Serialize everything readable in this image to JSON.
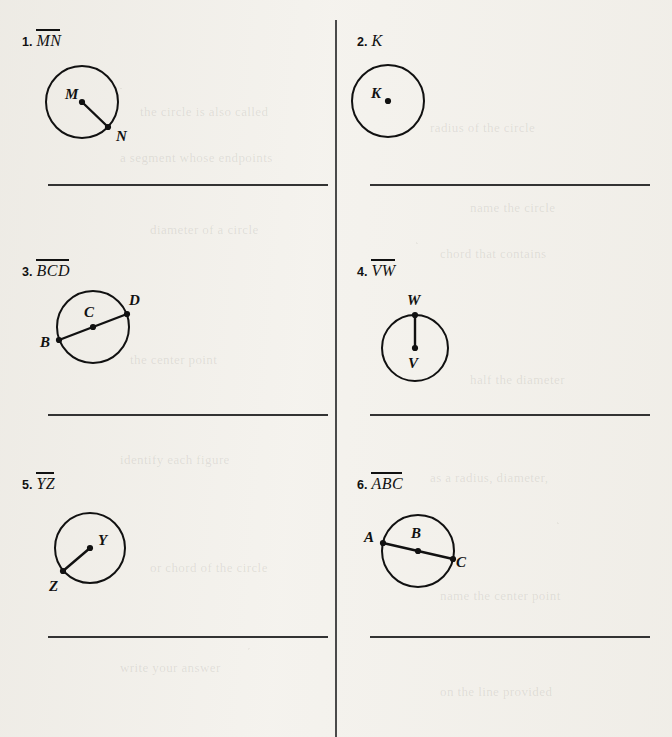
{
  "page": {
    "background_color": "#f3f1ec",
    "ink_color": "#111111",
    "divider": {
      "orientation": "vertical",
      "x": 335,
      "y": 20,
      "height": 717
    }
  },
  "ghost_text": [
    {
      "text": "the circle is also called",
      "x": 140,
      "y": 104
    },
    {
      "text": "radius of the circle",
      "x": 430,
      "y": 120
    },
    {
      "text": "a segment whose endpoints",
      "x": 120,
      "y": 150
    },
    {
      "text": "name the circle",
      "x": 470,
      "y": 200
    },
    {
      "text": "diameter of a circle",
      "x": 150,
      "y": 222
    },
    {
      "text": "chord that contains",
      "x": 440,
      "y": 246
    },
    {
      "text": "the center point",
      "x": 130,
      "y": 352
    },
    {
      "text": "half the diameter",
      "x": 470,
      "y": 372
    },
    {
      "text": "identify each figure",
      "x": 120,
      "y": 452
    },
    {
      "text": "as a radius, diameter,",
      "x": 430,
      "y": 470
    },
    {
      "text": "or chord of the circle",
      "x": 150,
      "y": 560
    },
    {
      "text": "name the center point",
      "x": 440,
      "y": 588
    },
    {
      "text": "write your answer",
      "x": 120,
      "y": 660
    },
    {
      "text": "on the line provided",
      "x": 440,
      "y": 684
    }
  ],
  "items": [
    {
      "number": "1.",
      "term": "MN",
      "overbar": true,
      "label": {
        "x": 22,
        "y": 32
      },
      "rule": {
        "x": 48,
        "y": 184,
        "width": 280
      },
      "figure": {
        "x": 30,
        "y": 55,
        "width": 130,
        "height": 110,
        "center": {
          "cx": 52,
          "cy": 47,
          "r": 36
        },
        "points": [
          {
            "name": "M",
            "cx": 52,
            "cy": 47,
            "label_x": 35,
            "label_y": 44,
            "type": "center"
          },
          {
            "name": "N",
            "cx": 78,
            "cy": 72,
            "label_x": 86,
            "label_y": 86,
            "type": "on-circle"
          }
        ],
        "segment": {
          "x1": 52,
          "y1": 47,
          "x2": 78,
          "y2": 72
        }
      }
    },
    {
      "number": "2.",
      "term": "K",
      "overbar": false,
      "label": {
        "x": 357,
        "y": 32
      },
      "rule": {
        "x": 370,
        "y": 184,
        "width": 280
      },
      "figure": {
        "x": 350,
        "y": 55,
        "width": 130,
        "height": 110,
        "center": {
          "cx": 38,
          "cy": 46,
          "r": 36
        },
        "points": [
          {
            "name": "K",
            "cx": 38,
            "cy": 46,
            "label_x": 21,
            "label_y": 43,
            "type": "center"
          }
        ],
        "segment": null
      }
    },
    {
      "number": "3.",
      "term": "BCD",
      "overbar": true,
      "label": {
        "x": 22,
        "y": 262
      },
      "rule": {
        "x": 48,
        "y": 414,
        "width": 280
      },
      "figure": {
        "x": 30,
        "y": 285,
        "width": 140,
        "height": 112,
        "center": {
          "cx": 63,
          "cy": 42,
          "r": 36
        },
        "points": [
          {
            "name": "B",
            "cx": 29,
            "cy": 55,
            "label_x": 10,
            "label_y": 62,
            "type": "on-circle"
          },
          {
            "name": "C",
            "cx": 63,
            "cy": 42,
            "label_x": 54,
            "label_y": 32,
            "type": "center"
          },
          {
            "name": "D",
            "cx": 97,
            "cy": 29,
            "label_x": 99,
            "label_y": 20,
            "type": "on-circle"
          }
        ],
        "segment": {
          "x1": 29,
          "y1": 55,
          "x2": 97,
          "y2": 29
        }
      }
    },
    {
      "number": "4.",
      "term": "VW",
      "overbar": true,
      "label": {
        "x": 357,
        "y": 262
      },
      "rule": {
        "x": 370,
        "y": 414,
        "width": 280
      },
      "figure": {
        "x": 350,
        "y": 288,
        "width": 135,
        "height": 115,
        "center": {
          "cx": 65,
          "cy": 60,
          "r": 33
        },
        "points": [
          {
            "name": "W",
            "cx": 65,
            "cy": 27,
            "label_x": 57,
            "label_y": 17,
            "type": "on-circle"
          },
          {
            "name": "V",
            "cx": 65,
            "cy": 60,
            "label_x": 58,
            "label_y": 80,
            "type": "center"
          }
        ],
        "segment": {
          "x1": 65,
          "y1": 27,
          "x2": 65,
          "y2": 60
        }
      }
    },
    {
      "number": "5.",
      "term": "YZ",
      "overbar": true,
      "label": {
        "x": 22,
        "y": 475
      },
      "rule": {
        "x": 48,
        "y": 636,
        "width": 280
      },
      "figure": {
        "x": 30,
        "y": 503,
        "width": 135,
        "height": 112,
        "center": {
          "cx": 60,
          "cy": 45,
          "r": 35
        },
        "points": [
          {
            "name": "Y",
            "cx": 60,
            "cy": 45,
            "label_x": 68,
            "label_y": 42,
            "type": "center"
          },
          {
            "name": "Z",
            "cx": 33,
            "cy": 68,
            "label_x": 19,
            "label_y": 88,
            "type": "on-circle"
          }
        ],
        "segment": {
          "x1": 60,
          "y1": 45,
          "x2": 33,
          "y2": 68
        }
      }
    },
    {
      "number": "6.",
      "term": "ABC",
      "overbar": true,
      "label": {
        "x": 357,
        "y": 475
      },
      "rule": {
        "x": 370,
        "y": 636,
        "width": 280
      },
      "figure": {
        "x": 350,
        "y": 505,
        "width": 140,
        "height": 112,
        "center": {
          "cx": 68,
          "cy": 46,
          "r": 36
        },
        "points": [
          {
            "name": "A",
            "cx": 33,
            "cy": 38,
            "label_x": 14,
            "label_y": 37,
            "type": "on-circle"
          },
          {
            "name": "B",
            "cx": 68,
            "cy": 46,
            "label_x": 61,
            "label_y": 33,
            "type": "center"
          },
          {
            "name": "C",
            "cx": 103,
            "cy": 54,
            "label_x": 106,
            "label_y": 62,
            "type": "on-circle"
          }
        ],
        "segment": {
          "x1": 33,
          "y1": 38,
          "x2": 103,
          "y2": 54
        }
      }
    }
  ]
}
